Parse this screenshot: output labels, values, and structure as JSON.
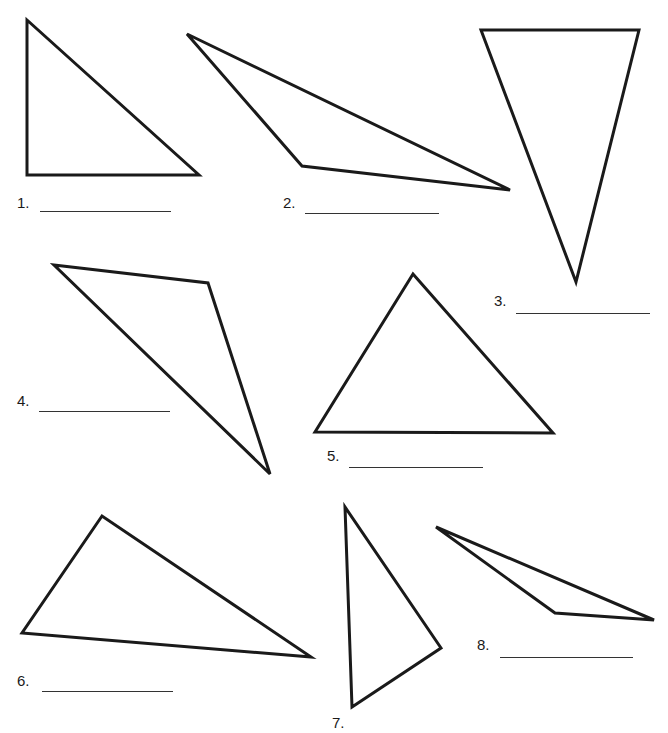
{
  "worksheet": {
    "items": [
      {
        "number": "1.",
        "points": "27,20 27,175 199,175",
        "label_x": 17,
        "label_y": 203,
        "blank_x": 40,
        "blank_y": 211,
        "blank_w": 131,
        "answer": ""
      },
      {
        "number": "2.",
        "points": "187,34 302,166 510,190",
        "label_x": 283,
        "label_y": 203,
        "blank_x": 305,
        "blank_y": 213,
        "blank_w": 134,
        "answer": ""
      },
      {
        "number": "3.",
        "points": "481,30 639,30 576,282",
        "label_x": 494,
        "label_y": 301,
        "blank_x": 516,
        "blank_y": 313,
        "blank_w": 134,
        "answer": ""
      },
      {
        "number": "4.",
        "points": "54,265 208,283 270,474",
        "label_x": 17,
        "label_y": 401,
        "blank_x": 39,
        "blank_y": 411,
        "blank_w": 131,
        "answer": ""
      },
      {
        "number": "5.",
        "points": "413,274 315,432 553,433",
        "label_x": 327,
        "label_y": 456,
        "blank_x": 349,
        "blank_y": 467,
        "blank_w": 134,
        "answer": ""
      },
      {
        "number": "6.",
        "points": "102,516 22,633 311,657",
        "label_x": 17,
        "label_y": 681,
        "blank_x": 42,
        "blank_y": 691,
        "blank_w": 131,
        "answer": ""
      },
      {
        "number": "7.",
        "points": "345,507 352,707 441,648",
        "label_x": 332,
        "label_y": 723,
        "blank_x": 0,
        "blank_y": 0,
        "blank_w": 0,
        "answer": ""
      },
      {
        "number": "8.",
        "points": "436,527 555,613 654,620",
        "label_x": 477,
        "label_y": 645,
        "blank_x": 500,
        "blank_y": 657,
        "blank_w": 133,
        "answer": ""
      }
    ]
  }
}
